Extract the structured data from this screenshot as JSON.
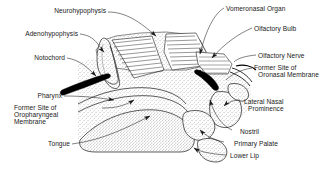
{
  "figure": {
    "type": "anatomical-diagram",
    "background_color": "#ffffff",
    "line_color": "#1a1a1a",
    "stipple_color": "#8c8c8c",
    "solid_fill_color": "#000000"
  },
  "labels": {
    "neurohypophysis": "Neurohypophysis",
    "adenohypophysis": "Adenohypophysis",
    "notochord": "Notochord",
    "pharynx": "Pharynx",
    "former_site_oropharyngeal_1": "Former Site of",
    "former_site_oropharyngeal_2": "Oropharyngeal",
    "former_site_oropharyngeal_3": "Membrane",
    "tongue": "Tongue",
    "vomeronasal_organ": "Vomeronasal Organ",
    "olfactory_bulb": "Olfactory Bulb",
    "olfactory_nerve": "Olfactory Nerve",
    "former_site_oronasal_1": "Former Site of",
    "former_site_oronasal_2": "Oronasal Membrane",
    "lateral_nasal_prominence_1": "Lateral Nasal",
    "lateral_nasal_prominence_2": "Prominence",
    "nostril": "Nostril",
    "primary_palate": "Primary Palate",
    "lower_lip": "Lower Lip"
  }
}
